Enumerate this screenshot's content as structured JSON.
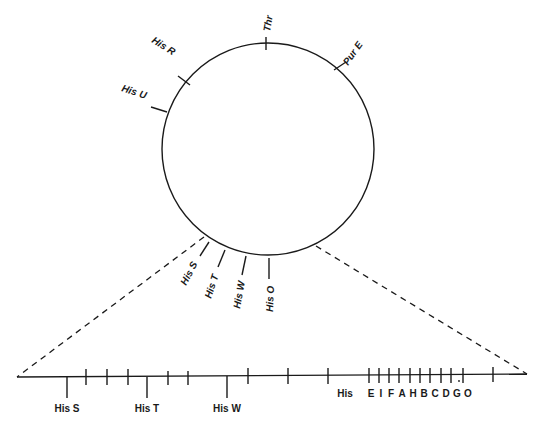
{
  "diagram": {
    "circle_markers": [
      {
        "label": "Thr"
      },
      {
        "label": "Pur E"
      },
      {
        "label": "His R"
      },
      {
        "label": "His U"
      },
      {
        "label": "His S"
      },
      {
        "label": "His T"
      },
      {
        "label": "His W"
      },
      {
        "label": "His O"
      }
    ],
    "linear_map": {
      "long_tick_labels": [
        "His S",
        "His T",
        "His W"
      ],
      "operon_label": "His",
      "operon_genes": [
        "E",
        "I",
        "F",
        "A",
        "H",
        "B",
        "C",
        "D",
        "G",
        "O"
      ]
    }
  }
}
